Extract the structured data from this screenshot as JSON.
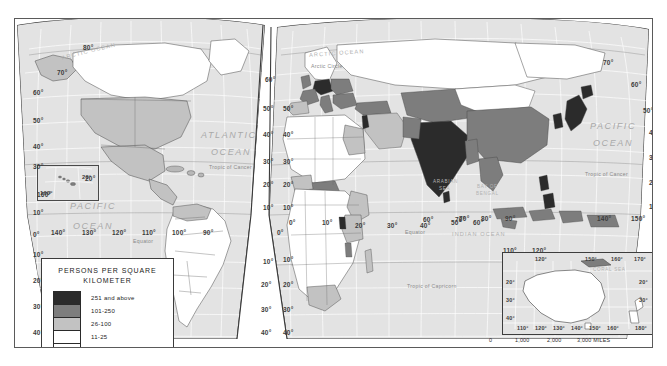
{
  "map": {
    "title": "World Population Density",
    "projection_note": "MODIFIED GOODE'S HOMOLOSINE EQUAL-AREA PROJECTION",
    "frame_color": "#5a5a5a",
    "ocean_color": "#e3e3e3",
    "graticule_color": "#ffffff"
  },
  "legend": {
    "title_line1": "PERSONS PER SQUARE",
    "title_line2": "KILOMETER",
    "classes": [
      {
        "label": "251 and above",
        "color": "#2b2b2b"
      },
      {
        "label": "101-250",
        "color": "#7d7d7d"
      },
      {
        "label": "26-100",
        "color": "#c2c2c2"
      },
      {
        "label": "11-25",
        "color": "#ffffff"
      },
      {
        "label": "0-10",
        "color": "#ffffff"
      }
    ]
  },
  "ocean_labels": [
    {
      "text": "ARCTIC OCEAN",
      "x": 46,
      "y": 29,
      "cls": "ocean-sm",
      "rot": -14
    },
    {
      "text": "ARCTIC OCEAN",
      "x": 294,
      "y": 31,
      "cls": "ocean-sm",
      "rot": -4
    },
    {
      "text": "ATLANTIC",
      "x": 186,
      "y": 111,
      "cls": "ocean-lbl",
      "rot": 0
    },
    {
      "text": "OCEAN",
      "x": 196,
      "y": 128,
      "cls": "ocean-lbl",
      "rot": 0
    },
    {
      "text": "PACIFIC",
      "x": 55,
      "y": 182,
      "cls": "ocean-lbl",
      "rot": 0
    },
    {
      "text": "OCEAN",
      "x": 58,
      "y": 202,
      "cls": "ocean-lbl",
      "rot": 0
    },
    {
      "text": "PACIFIC",
      "x": 575,
      "y": 102,
      "cls": "ocean-lbl",
      "rot": 0
    },
    {
      "text": "OCEAN",
      "x": 578,
      "y": 119,
      "cls": "ocean-lbl",
      "rot": 0
    },
    {
      "text": "INDIAN OCEAN",
      "x": 437,
      "y": 212,
      "cls": "ocean-sm",
      "rot": 0
    }
  ],
  "sea_labels": [
    {
      "text": "ARABIAN",
      "x": 418,
      "y": 160
    },
    {
      "text": "SEA",
      "x": 424,
      "y": 167
    },
    {
      "text": "BAY OF",
      "x": 462,
      "y": 165
    },
    {
      "text": "BENGAL",
      "x": 461,
      "y": 172
    },
    {
      "text": "CORAL SEA",
      "x": 578,
      "y": 248
    }
  ],
  "line_labels": [
    {
      "text": "Arctic Circle",
      "x": 296,
      "y": 44
    },
    {
      "text": "Tropic of Cancer",
      "x": 194,
      "y": 145
    },
    {
      "text": "Tropic of Cancer",
      "x": 570,
      "y": 152
    },
    {
      "text": "Equator",
      "x": 118,
      "y": 219
    },
    {
      "text": "Equator",
      "x": 390,
      "y": 210
    },
    {
      "text": "Tropic of Capricorn",
      "x": 392,
      "y": 264
    }
  ],
  "grid_labels": [
    {
      "text": "80°",
      "x": 68,
      "y": 25
    },
    {
      "text": "70°",
      "x": 42,
      "y": 50
    },
    {
      "text": "60°",
      "x": 18,
      "y": 70
    },
    {
      "text": "50°",
      "x": 18,
      "y": 98
    },
    {
      "text": "40°",
      "x": 18,
      "y": 124
    },
    {
      "text": "30°",
      "x": 18,
      "y": 144
    },
    {
      "text": "160°",
      "x": 22,
      "y": 172
    },
    {
      "text": "20°",
      "x": 70,
      "y": 156
    },
    {
      "text": "10°",
      "x": 18,
      "y": 190
    },
    {
      "text": "0°",
      "x": 18,
      "y": 212
    },
    {
      "text": "140°",
      "x": 36,
      "y": 210
    },
    {
      "text": "130°",
      "x": 67,
      "y": 210
    },
    {
      "text": "120°",
      "x": 97,
      "y": 210
    },
    {
      "text": "110°",
      "x": 127,
      "y": 210
    },
    {
      "text": "100°",
      "x": 157,
      "y": 210
    },
    {
      "text": "90°",
      "x": 188,
      "y": 210
    },
    {
      "text": "10°",
      "x": 18,
      "y": 232
    },
    {
      "text": "20°",
      "x": 18,
      "y": 258
    },
    {
      "text": "30°",
      "x": 18,
      "y": 284
    },
    {
      "text": "40°",
      "x": 18,
      "y": 310
    },
    {
      "text": "50°",
      "x": 18,
      "y": 332
    },
    {
      "text": "60°",
      "x": 250,
      "y": 57
    },
    {
      "text": "50°",
      "x": 248,
      "y": 86
    },
    {
      "text": "40°",
      "x": 248,
      "y": 112
    },
    {
      "text": "30°",
      "x": 248,
      "y": 139
    },
    {
      "text": "10°",
      "x": 248,
      "y": 185
    },
    {
      "text": "20°",
      "x": 248,
      "y": 162
    },
    {
      "text": "10°",
      "x": 248,
      "y": 239
    },
    {
      "text": "20°",
      "x": 246,
      "y": 262
    },
    {
      "text": "30°",
      "x": 246,
      "y": 287
    },
    {
      "text": "40°",
      "x": 246,
      "y": 310
    },
    {
      "text": "50°",
      "x": 246,
      "y": 331
    },
    {
      "text": "50°",
      "x": 268,
      "y": 86
    },
    {
      "text": "40°",
      "x": 268,
      "y": 112
    },
    {
      "text": "30°",
      "x": 268,
      "y": 139
    },
    {
      "text": "20°",
      "x": 268,
      "y": 162
    },
    {
      "text": "10°",
      "x": 268,
      "y": 185
    },
    {
      "text": "0°",
      "x": 262,
      "y": 210
    },
    {
      "text": "10°",
      "x": 268,
      "y": 237
    },
    {
      "text": "20°",
      "x": 268,
      "y": 262
    },
    {
      "text": "30°",
      "x": 268,
      "y": 287
    },
    {
      "text": "40°",
      "x": 268,
      "y": 310
    },
    {
      "text": "50°",
      "x": 268,
      "y": 331
    },
    {
      "text": "0°",
      "x": 274,
      "y": 200
    },
    {
      "text": "10°",
      "x": 307,
      "y": 200
    },
    {
      "text": "20°",
      "x": 340,
      "y": 203
    },
    {
      "text": "30°",
      "x": 372,
      "y": 203
    },
    {
      "text": "40°",
      "x": 405,
      "y": 203
    },
    {
      "text": "50°",
      "x": 436,
      "y": 200
    },
    {
      "text": "60°",
      "x": 458,
      "y": 200
    },
    {
      "text": "70°",
      "x": 440,
      "y": 197
    },
    {
      "text": "60°",
      "x": 408,
      "y": 197
    },
    {
      "text": "70°",
      "x": 444,
      "y": 196
    },
    {
      "text": "80°",
      "x": 466,
      "y": 196
    },
    {
      "text": "90°",
      "x": 490,
      "y": 196
    },
    {
      "text": "110°",
      "x": 488,
      "y": 228
    },
    {
      "text": "120°",
      "x": 517,
      "y": 228
    },
    {
      "text": "140°",
      "x": 582,
      "y": 196
    },
    {
      "text": "150°",
      "x": 616,
      "y": 196
    },
    {
      "text": "50°",
      "x": 628,
      "y": 88
    },
    {
      "text": "40°",
      "x": 634,
      "y": 110
    },
    {
      "text": "30°",
      "x": 634,
      "y": 135
    },
    {
      "text": "20°",
      "x": 634,
      "y": 160
    },
    {
      "text": "10°",
      "x": 634,
      "y": 184
    },
    {
      "text": "60°",
      "x": 616,
      "y": 62
    },
    {
      "text": "70°",
      "x": 588,
      "y": 40
    }
  ],
  "australia_inset": {
    "top_labels": [
      {
        "text": "120°",
        "x": 32
      },
      {
        "text": "150°",
        "x": 82
      },
      {
        "text": "160°",
        "x": 108
      },
      {
        "text": "170°",
        "x": 131
      }
    ],
    "side_labels": [
      {
        "text": "20°",
        "y": 26
      },
      {
        "text": "30°",
        "y": 44
      },
      {
        "text": "40°",
        "y": 62
      }
    ],
    "side_labels_right": [
      {
        "text": "20°",
        "y": 26
      },
      {
        "text": "30°",
        "y": 44
      }
    ],
    "bottom_labels": [
      {
        "text": "110°",
        "x": 14
      },
      {
        "text": "120°",
        "x": 32
      },
      {
        "text": "130°",
        "x": 50
      },
      {
        "text": "140°",
        "x": 68
      },
      {
        "text": "150°",
        "x": 86
      },
      {
        "text": "160°",
        "x": 104
      },
      {
        "text": "180°",
        "x": 132
      }
    ]
  },
  "scalebar": {
    "miles_ticks": [
      "0",
      "1,000",
      "2,000",
      "3,000 MILES"
    ],
    "km_ticks": [
      "0",
      "1,000",
      "2,000",
      "3,000 KILOMETERS"
    ]
  },
  "hawaii_inset": {
    "longitude_label": "160°",
    "inner_label": "20°"
  }
}
